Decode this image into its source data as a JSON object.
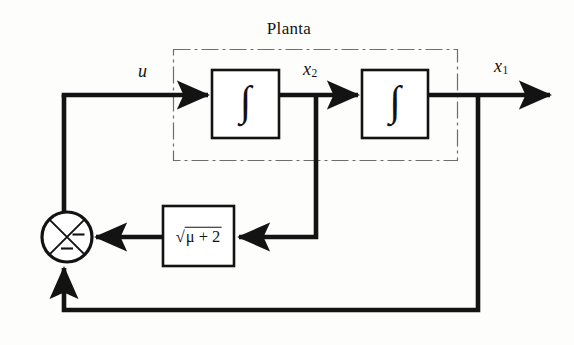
{
  "diagram": {
    "title": "Planta",
    "type": "control-system-block-diagram",
    "signals": {
      "input_label": "u",
      "state2_label": "x",
      "state2_sub": "2",
      "state1_label": "x",
      "state1_sub": "1"
    },
    "blocks": {
      "integrator1_label": "∫",
      "integrator2_label": "∫",
      "gain_radical_symbol": "√",
      "gain_radicand": "μ + 2",
      "gain_full_text": "√(μ + 2)"
    },
    "summing_junction": {
      "sign_right": "−",
      "sign_bottom": "−",
      "style": "circle-with-x-cross"
    },
    "colors": {
      "line": "#131313",
      "text": "#131313",
      "background": "#fdfdfc",
      "plant_border": "#6d6d6d"
    }
  }
}
